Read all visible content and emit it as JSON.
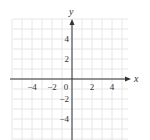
{
  "chart_data": {
    "type": "line",
    "title": "",
    "xlabel": "x",
    "ylabel": "y",
    "xlim": [
      -6,
      5.5
    ],
    "ylim": [
      -6,
      6
    ],
    "grid": true,
    "grid_step": 1,
    "x_ticks": [
      -4,
      -2,
      0,
      2,
      4
    ],
    "y_ticks": [
      4,
      2,
      -2,
      -4
    ],
    "x_tick_labels": [
      "−4",
      "−2",
      "0",
      "2",
      "4"
    ],
    "y_tick_labels": [
      "4",
      "2",
      "−2",
      "−4"
    ],
    "series": []
  },
  "labels": {
    "x_axis": "x",
    "y_axis": "y",
    "origin": "0"
  },
  "colors": {
    "axis": "#333333",
    "grid": "#e6e6e6",
    "text": "#333333"
  }
}
